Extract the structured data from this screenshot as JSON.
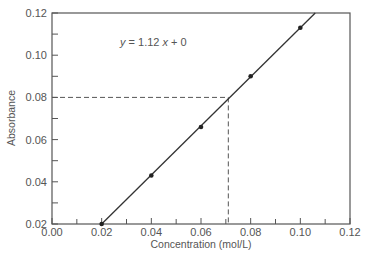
{
  "chart_data": {
    "type": "scatter",
    "title": "",
    "xlabel": "Concentration (mol/L)",
    "ylabel": "Absorbance",
    "xlim": [
      0.0,
      0.12
    ],
    "ylim": [
      0.02,
      0.12
    ],
    "x_ticks": [
      "0.00",
      "0.02",
      "0.04",
      "0.06",
      "0.08",
      "0.10",
      "0.12"
    ],
    "y_ticks": [
      "0.02",
      "0.04",
      "0.06",
      "0.08",
      "0.10",
      "0.12"
    ],
    "x_minor_step": 0.01,
    "y_minor_step": 0.01,
    "grid": false,
    "legend": null,
    "series": [
      {
        "name": "Measured absorbance",
        "x": [
          0.02,
          0.04,
          0.06,
          0.08,
          0.1
        ],
        "y": [
          0.02,
          0.043,
          0.066,
          0.09,
          0.113
        ]
      }
    ],
    "fit_line": {
      "equation": "y = 1.12 x + 0",
      "x": [
        0.02,
        0.106
      ],
      "y": [
        0.02,
        0.12
      ]
    },
    "annotations": [
      {
        "type": "equation",
        "text": "y = 1.12 x + 0",
        "x": 0.033,
        "y": 0.106
      },
      {
        "type": "dashed_guide",
        "description": "Unknown sample: absorbance 0.08 read to concentration",
        "absorbance": 0.08,
        "concentration": 0.071
      }
    ]
  },
  "labels": {
    "equation_y": "y",
    "equation_rest": " = 1.12 ",
    "equation_x": "x",
    "equation_tail": " + 0"
  },
  "colors": {
    "axis": "#555555",
    "line": "#333333",
    "points": "#222222",
    "dashed": "#555555",
    "text": "#555555"
  }
}
